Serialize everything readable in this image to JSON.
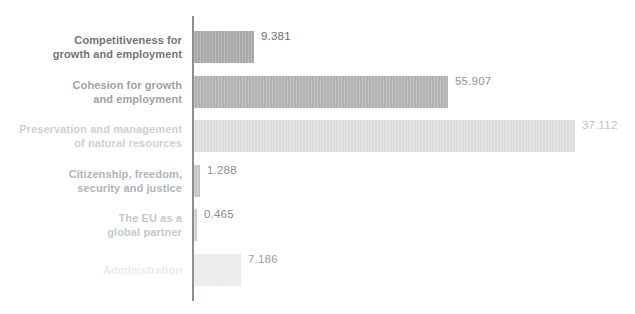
{
  "chart_data": {
    "type": "bar",
    "orientation": "horizontal",
    "title": "",
    "xlabel": "",
    "ylabel": "",
    "grid": false,
    "legend": false,
    "background": "#ffffff",
    "axis_color": "#8a8f94",
    "categories": [
      "Competitiveness for growth and employment",
      "Cohesion for growth and employment",
      "Preservation and management of natural resources",
      "Citizenship, freedom, security and justice",
      "The EU as a global partner",
      "Administration"
    ],
    "values": [
      9.381,
      55.907,
      37.112,
      1.288,
      0.465,
      7.186
    ],
    "value_labels": [
      "9.381",
      "55.907",
      "37.112",
      "1.288",
      "0.465",
      "7.186"
    ],
    "rows": [
      {
        "label_line1": "Competitiveness for",
        "label_line2": "growth and employment",
        "value_label": "9.381",
        "bar_width_px": 60,
        "bar_color": "#a8a8a8",
        "label_color": "#6f757c",
        "value_color": "#6a6d71"
      },
      {
        "label_line1": "Cohesion for growth",
        "label_line2": "and employment",
        "value_label": "55.907",
        "bar_width_px": 254,
        "bar_color": "#b2b2b2",
        "label_color": "#9ba2a9",
        "value_color": "#939699"
      },
      {
        "label_line1": "Preservation and management",
        "label_line2": "of natural resources",
        "value_label": "37.112",
        "bar_width_px": 381,
        "bar_color": "#dddddd",
        "label_color": "#ccd1d6",
        "value_color": "#c2c5c8"
      },
      {
        "label_line1": "Citizenship, freedom,",
        "label_line2": "security and justice",
        "value_label": "1.288",
        "bar_width_px": 6,
        "bar_color": "#c5c5c5",
        "label_color": "#aeb5bc",
        "value_color": "#8d9094"
      },
      {
        "label_line1": "The EU as a",
        "label_line2": "global partner",
        "value_label": "0.465",
        "bar_width_px": 3,
        "bar_color": "#d0d0d0",
        "label_color": "#c3c9cf",
        "value_color": "#888b8f"
      },
      {
        "label_line1": "Administration",
        "label_line2": "",
        "value_label": "7.186",
        "bar_width_px": 47,
        "bar_color": "#ebebeb",
        "label_color": "#e9ebed",
        "value_color": "#9b9ea1"
      }
    ]
  }
}
